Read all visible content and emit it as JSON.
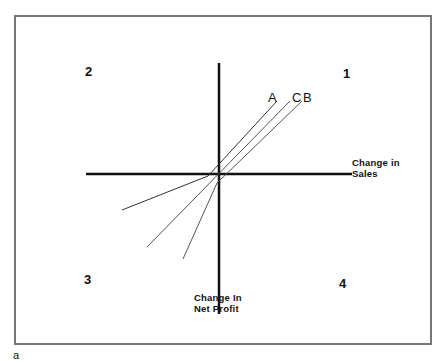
{
  "figure": {
    "caption": "a",
    "quadrants": {
      "q1": "1",
      "q2": "2",
      "q3": "3",
      "q4": "4"
    },
    "x_axis_label_line1": "Change in",
    "x_axis_label_line2": "Sales",
    "y_axis_label_line1": "Change In",
    "y_axis_label_line2": "Net Profit",
    "lines": [
      {
        "label": "A",
        "color": "#333333"
      },
      {
        "label": "C",
        "color": "#555555"
      },
      {
        "label": "B",
        "color": "#555555"
      }
    ]
  }
}
